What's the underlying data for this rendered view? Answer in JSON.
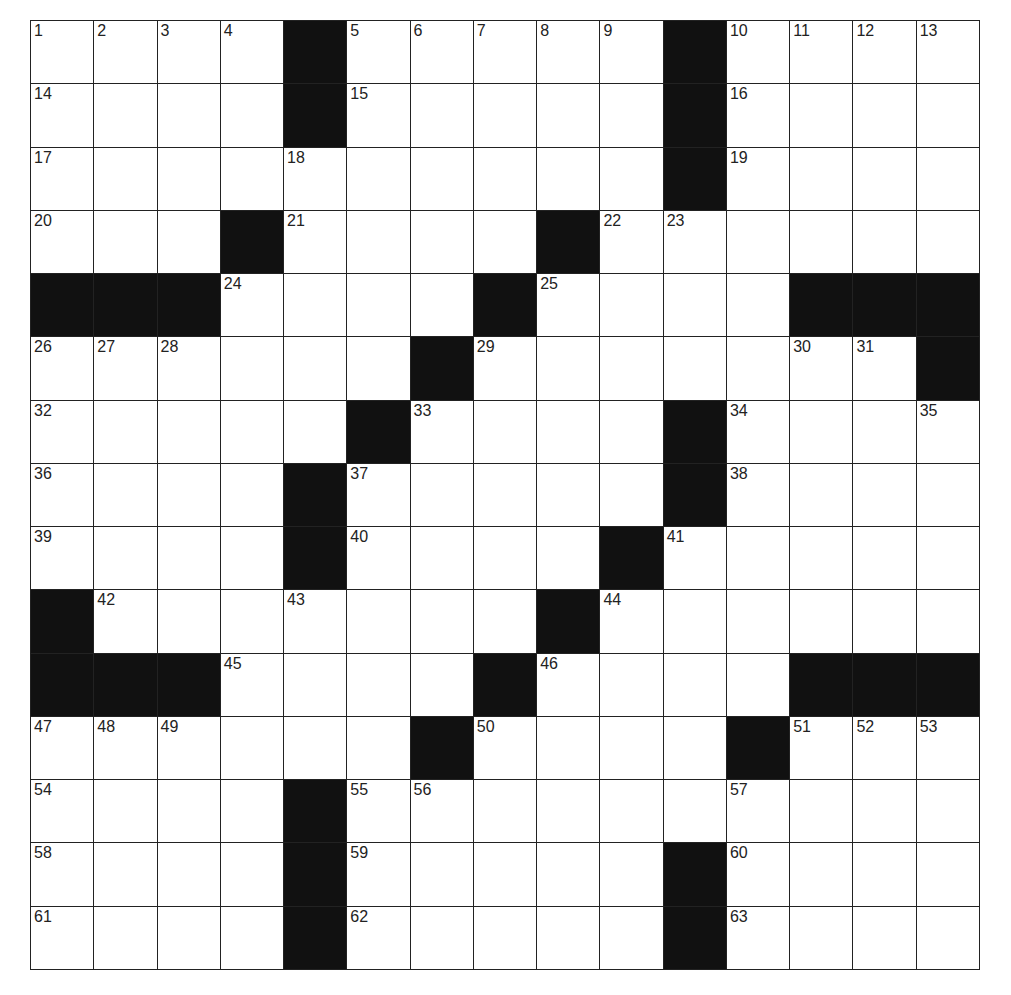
{
  "puzzle": {
    "size": 15,
    "rows": [
      "....#.....#....",
      "....#.....#....",
      "..........#....",
      "...#....#......",
      "###....#....###",
      "......#.......#",
      ".....#....#....",
      "....#.....#....",
      "....#....#.....",
      "#.......#......",
      "###....#....###",
      "......#....#...",
      "....#..........",
      "....#.....#....",
      "....#.....#...."
    ],
    "numbers": [
      1,
      2,
      3,
      4,
      5,
      6,
      7,
      8,
      9,
      10,
      11,
      12,
      13,
      14,
      15,
      16,
      17,
      18,
      19,
      20,
      21,
      22,
      23,
      24,
      25,
      26,
      27,
      28,
      29,
      30,
      31,
      32,
      33,
      34,
      35,
      36,
      37,
      38,
      39,
      40,
      41,
      42,
      43,
      44,
      45,
      46,
      47,
      48,
      49,
      50,
      51,
      52,
      53,
      54,
      55,
      56,
      57,
      58,
      59,
      60,
      61,
      62,
      63
    ],
    "colors": {
      "block": "#111111",
      "cell": "#ffffff",
      "line": "#222222"
    }
  }
}
